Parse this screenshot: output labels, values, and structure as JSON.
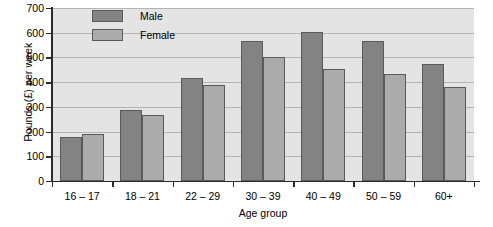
{
  "chart_data": {
    "type": "bar",
    "title": "",
    "xlabel": "Age group",
    "ylabel": "Pounds (£) per week",
    "categories": [
      "16 – 17",
      "18 – 21",
      "22 – 29",
      "30 – 39",
      "40 – 49",
      "50 – 59",
      "60+"
    ],
    "series": [
      {
        "name": "Male",
        "color": "#838383",
        "values": [
          178,
          287,
          417,
          566,
          604,
          567,
          472
        ]
      },
      {
        "name": "Female",
        "color": "#ababab",
        "values": [
          190,
          267,
          388,
          500,
          453,
          432,
          380
        ]
      }
    ],
    "ylim": [
      0,
      700
    ],
    "yticks": [
      0,
      100,
      200,
      300,
      400,
      500,
      600,
      700
    ],
    "ytick_labels": [
      "0",
      "100",
      "200",
      "300",
      "400",
      "500",
      "600",
      "700"
    ],
    "grid": true,
    "legend_position": "top-left-inside",
    "plot_background": "#e4e4e4",
    "axis_color": "#2b2b2b",
    "gridline_color": "#b4b4b4"
  }
}
